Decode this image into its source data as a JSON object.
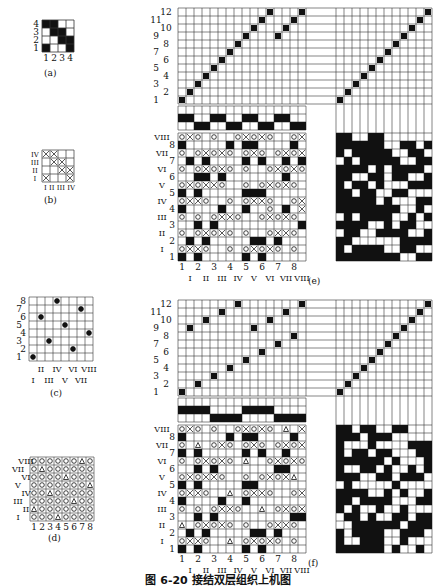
{
  "figure": {
    "caption": "图 6-20   接结双层组织上机图",
    "panels": {
      "a": {
        "label": "(a)",
        "rows": [
          "1",
          "2",
          "3",
          "4"
        ],
        "cols": [
          "1",
          "2",
          "3",
          "4"
        ],
        "grid": [
          [
            1,
            0,
            0,
            1
          ],
          [
            0,
            0,
            1,
            1
          ],
          [
            0,
            1,
            1,
            0
          ],
          [
            1,
            1,
            0,
            0
          ]
        ]
      },
      "b": {
        "label": "(b)",
        "rows": [
          "I",
          "II",
          "III",
          "IV"
        ],
        "cols": [
          "I",
          "II",
          "III",
          "IV"
        ],
        "grid": [
          [
            1,
            0,
            0,
            1
          ],
          [
            0,
            0,
            1,
            1
          ],
          [
            0,
            1,
            1,
            0
          ],
          [
            1,
            1,
            0,
            0
          ]
        ]
      },
      "c": {
        "label": "(c)",
        "rows": [
          "1",
          "2",
          "3",
          "4",
          "5",
          "6",
          "7",
          "8"
        ],
        "cols_upper": [
          "II",
          "IV",
          "VI",
          "VIII"
        ],
        "cols_lower": [
          "I",
          "III",
          "V",
          "VII"
        ],
        "dots": [
          [
            0,
            0
          ],
          [
            1,
            5
          ],
          [
            2,
            2
          ],
          [
            3,
            7
          ],
          [
            4,
            4
          ],
          [
            5,
            1
          ],
          [
            6,
            6
          ],
          [
            7,
            3
          ]
        ]
      },
      "d": {
        "label": "(d)",
        "rows": [
          "I",
          "II",
          "III",
          "IV",
          "V",
          "VI",
          "VII",
          "VIII"
        ],
        "cols": [
          "1",
          "2",
          "3",
          "4",
          "5",
          "6",
          "7",
          "8"
        ],
        "triangles": [
          [
            3,
            0
          ],
          [
            0,
            1
          ],
          [
            5,
            2
          ],
          [
            2,
            3
          ],
          [
            7,
            4
          ],
          [
            4,
            5
          ],
          [
            1,
            6
          ],
          [
            6,
            7
          ]
        ]
      },
      "e": {
        "label": "(e)",
        "threading_row_labels": [
          "1",
          "2",
          "3",
          "4",
          "5",
          "6",
          "7",
          "8",
          "9",
          "10",
          "11",
          "12"
        ],
        "threading": [
          0,
          1,
          2,
          3,
          4,
          5,
          6,
          7,
          8,
          9,
          10,
          11,
          8,
          9,
          10,
          11
        ],
        "threading_note": "16 ends; rows 1-4 ground shafts, 5-12 pattern",
        "reed": [
          [
            1,
            1,
            0,
            0,
            1,
            1,
            0,
            0,
            1,
            1,
            0,
            0,
            1,
            1,
            0,
            0
          ],
          [
            0,
            0,
            1,
            1,
            0,
            0,
            1,
            1,
            0,
            0,
            1,
            1,
            0,
            0,
            1,
            1
          ]
        ],
        "weave_row_labels_arabic": [
          "1",
          "2",
          "3",
          "4",
          "5",
          "6",
          "7",
          "8"
        ],
        "weave_row_labels_roman": [
          "I",
          "II",
          "III",
          "IV",
          "V",
          "VI",
          "VII",
          "VIII"
        ],
        "col_labels_arabic": [
          "1",
          "2",
          "3",
          "4",
          "5",
          "6",
          "7",
          "8"
        ],
        "col_labels_roman": [
          "I",
          "II",
          "III",
          "IV",
          "V",
          "VI",
          "VII",
          "VIII"
        ],
        "weave": [
          "B.B.....B.B.....",
          "oXXo..o.oXoXo.o.",
          ".B.B.....BB.B...",
          "o.oXoXo.o..oXXo.",
          "..B.B..........B",
          "o.o.oXXo..oXoXo.",
          "B....B..B..o.B.X",
          "oXXo..o.oXXo..oX",
          "B.B.....BBB.....",
          "oXoXXo..o.oXoXo.",
          "..BB.B.......B..",
          "o.oXoXo.o..oXoXo",
          ".B.B....B.B..B.B",
          "o.oXoXo.oXo.oXoX",
          "B.....B.BB....B.",
          "oXo.o..oXoXo..oX"
        ],
        "peg_plan": [
          "111111110011011",
          "101111001100111",
          "110000001111000",
          "011001111001100",
          "111100101100110",
          "010111100101110",
          "111111110010011",
          "111110100011100",
          "110110011000110",
          "101101000111010",
          "110011011001101",
          "111101011110011",
          "010111110011010",
          "101111100110110",
          "111111001101100",
          "110011000000000"
        ]
      },
      "f": {
        "label": "(f)",
        "threading_row_labels": [
          "1",
          "2",
          "3",
          "4",
          "5",
          "6",
          "7",
          "8",
          "9",
          "10",
          "11",
          "12"
        ],
        "threading": [
          0,
          8,
          1,
          9,
          2,
          10,
          3,
          11,
          4,
          8,
          5,
          9,
          6,
          10,
          7,
          11
        ],
        "reed": [
          [
            1,
            1,
            1,
            1,
            0,
            0,
            0,
            0,
            1,
            1,
            1,
            1,
            0,
            0,
            0,
            0
          ],
          [
            0,
            0,
            0,
            0,
            1,
            1,
            1,
            1,
            0,
            0,
            0,
            0,
            1,
            1,
            1,
            1
          ]
        ],
        "weave_row_labels_arabic": [
          "1",
          "2",
          "3",
          "4",
          "5",
          "6",
          "7",
          "8"
        ],
        "weave_row_labels_roman": [
          "I",
          "II",
          "III",
          "IV",
          "V",
          "VI",
          "VII",
          "VIII"
        ],
        "col_labels_arabic": [
          "1",
          "2",
          "3",
          "4",
          "5",
          "6",
          "7",
          "8"
        ],
        "col_labels_roman": [
          "I",
          "II",
          "III",
          "IV",
          "V",
          "VI",
          "VII",
          "VIII"
        ],
        "weave": [
          "B.B.....B.B.....",
          "oXXo..T.oXoXo.o.",
          ".B.B.....BB.B...",
          "T.oXoXo.o..oXXo.",
          "..B.B.........BB",
          "o.o.oXXo..T.oXoX",
          "B....B..B.......",
          "oXXo..T.oXXo..oX",
          "B.B.....BB......",
          "oXoXXo..o.oXoXT.",
          "..B.B.......BB..",
          "o.oXoXo.T..oXoXo",
          "B.B.....B.B..B..",
          "o.T.oXo.oXo.oXoX",
          "B.....B.BB....B.",
          "oXo.o..oXoXo.T.X"
        ],
        "peg_plan": [
          "111111010010001",
          "100111001000111",
          "101111001110000",
          "001111110111011",
          "011010011011101",
          "101001001000110",
          "110111100011001",
          "111100101001100",
          "010000010000110",
          "111001101110011",
          "100110100101010",
          "111111010001110",
          "101101100011001",
          "100010000111110",
          "111011100000011",
          "110110011000000"
        ]
      }
    },
    "colors": {
      "ink": "#111111",
      "grid": "#333333",
      "paper": "#ffffff"
    }
  }
}
